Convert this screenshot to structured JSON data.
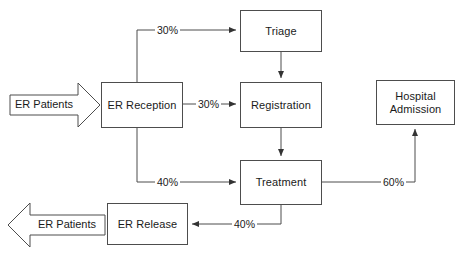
{
  "diagram": {
    "type": "flowchart",
    "background_color": "#ffffff",
    "line_color": "#4d4d4d",
    "text_color": "#1a1a1a",
    "nodes": [
      {
        "id": "er_reception",
        "label": "ER Reception",
        "shape": "rectangle"
      },
      {
        "id": "triage",
        "label": "Triage",
        "shape": "rectangle"
      },
      {
        "id": "registration",
        "label": "Registration",
        "shape": "rectangle"
      },
      {
        "id": "treatment",
        "label": "Treatment",
        "shape": "rectangle"
      },
      {
        "id": "hospital_admission",
        "label": "Hospital\nAdmission",
        "line1": "Hospital",
        "line2": "Admission",
        "shape": "rectangle"
      },
      {
        "id": "er_release",
        "label": "ER Release",
        "shape": "rectangle"
      }
    ],
    "io_arrows": [
      {
        "id": "input_patients",
        "label": "ER Patients",
        "direction": "right"
      },
      {
        "id": "output_patients",
        "label": "ER Patients",
        "direction": "left"
      }
    ],
    "edges": [
      {
        "from": "er_reception",
        "to": "triage",
        "label": "30%"
      },
      {
        "from": "er_reception",
        "to": "registration",
        "label": "30%"
      },
      {
        "from": "er_reception",
        "to": "treatment",
        "label": "40%"
      },
      {
        "from": "triage",
        "to": "registration",
        "label": ""
      },
      {
        "from": "registration",
        "to": "treatment",
        "label": ""
      },
      {
        "from": "treatment",
        "to": "hospital_admission",
        "label": "60%"
      },
      {
        "from": "treatment",
        "to": "er_release",
        "label": "40%"
      },
      {
        "from": "er_release",
        "to": "output_patients",
        "label": ""
      }
    ]
  }
}
